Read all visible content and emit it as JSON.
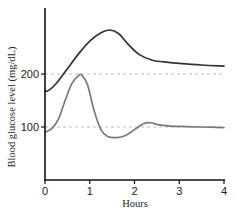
{
  "chart_data": {
    "type": "line",
    "title": "",
    "xlabel": "Hours",
    "ylabel": "Blood glucose level (mg/dL)",
    "xlim": [
      0,
      4
    ],
    "ylim": [
      0,
      325
    ],
    "x_ticks": [
      "0",
      "1",
      "2",
      "3",
      "4"
    ],
    "y_ticks": [
      "100",
      "200"
    ],
    "reference_lines": [
      {
        "y": 200,
        "style": "dashed",
        "color": "#bbbbbb"
      },
      {
        "y": 100,
        "style": "dashed",
        "color": "#bbbbbb"
      }
    ],
    "grid": false,
    "legend": null,
    "series": [
      {
        "name": "upper curve",
        "color": "#333333",
        "x": [
          0,
          0.1,
          0.25,
          0.5,
          0.75,
          1.0,
          1.25,
          1.45,
          1.65,
          1.85,
          2.1,
          2.4,
          2.75,
          3.0,
          3.5,
          4.0
        ],
        "y": [
          167,
          170,
          182,
          210,
          238,
          262,
          278,
          283,
          276,
          257,
          237,
          226,
          222,
          220,
          217,
          215
        ]
      },
      {
        "name": "lower curve",
        "color": "#7a7a7a",
        "x": [
          0,
          0.15,
          0.3,
          0.45,
          0.6,
          0.75,
          0.82,
          0.95,
          1.1,
          1.25,
          1.4,
          1.6,
          1.8,
          2.0,
          2.2,
          2.35,
          2.55,
          2.75,
          3.0,
          3.5,
          4.0
        ],
        "y": [
          90,
          97,
          115,
          150,
          182,
          197,
          198,
          180,
          130,
          95,
          82,
          80,
          84,
          95,
          106,
          108,
          104,
          102,
          101,
          100,
          99
        ]
      }
    ]
  }
}
